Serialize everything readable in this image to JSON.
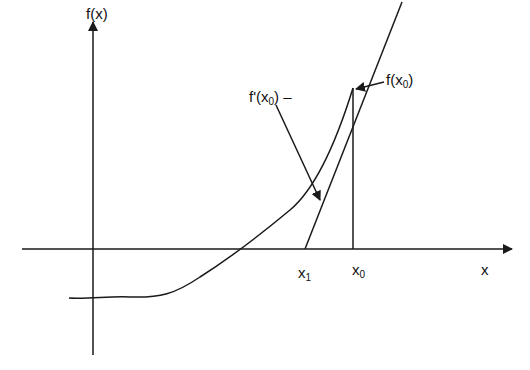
{
  "diagram": {
    "labels": {
      "y_axis": "f(x)",
      "x_axis": "x",
      "x0": "x",
      "x0_sub": "0",
      "x1": "x",
      "x1_sub": "1",
      "fx0_prefix": "f(x",
      "fx0_sub": "0",
      "fx0_suffix": ")",
      "fprime_prefix": "f'(x",
      "fprime_sub": "0",
      "fprime_suffix": ") –"
    },
    "colors": {
      "stroke": "#1a1a1a",
      "background": "#ffffff"
    }
  }
}
